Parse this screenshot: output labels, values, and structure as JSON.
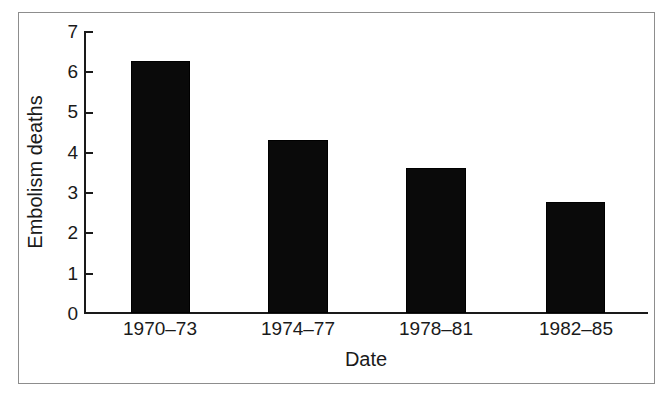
{
  "chart_data": {
    "type": "bar",
    "title": "",
    "subtitle": "",
    "xlabel": "Date",
    "ylabel": "Embolism deaths",
    "categories": [
      "1970–73",
      "1974–77",
      "1978–81",
      "1982–85"
    ],
    "values": [
      6.25,
      4.3,
      3.6,
      2.75
    ],
    "series": [
      {
        "name": "Embolism deaths",
        "values": [
          6.25,
          4.3,
          3.6,
          2.75
        ]
      }
    ],
    "ylim": [
      0,
      7
    ],
    "ytick_labels": [
      "7",
      "6",
      "5",
      "4",
      "3",
      "2",
      "1",
      "0"
    ],
    "ytick_values": [
      7,
      6,
      5,
      4,
      3,
      2,
      1,
      0
    ],
    "grid": false,
    "legend": false,
    "legend_position": "none",
    "annotations": [],
    "bar_color": "#0a0a0a",
    "axis_color": "#1a1a1a",
    "frame_color": "#8d8d8d",
    "background_color": "#ffffff"
  }
}
